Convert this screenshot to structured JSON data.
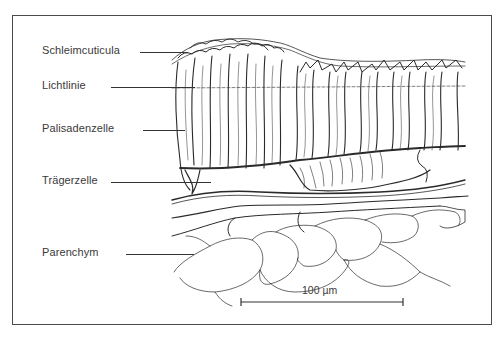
{
  "figure": {
    "type": "botanical cross-section line drawing",
    "labels": [
      {
        "id": "schleimcuticula",
        "text": "Schleimcuticula"
      },
      {
        "id": "lichtlinie",
        "text": "Lichtlinie"
      },
      {
        "id": "palisadenzelle",
        "text": "Palisadenzelle"
      },
      {
        "id": "traegerzelle",
        "text": "Trägerzelle"
      },
      {
        "id": "parenchym",
        "text": "Parenchym"
      }
    ],
    "scale_bar": {
      "text": "100 µm",
      "value": 100,
      "unit": "µm"
    },
    "colors": {
      "line": "#2a2a2a",
      "text": "#3a3a3a",
      "frame": "#4a4a4a",
      "background": "#ffffff"
    }
  }
}
